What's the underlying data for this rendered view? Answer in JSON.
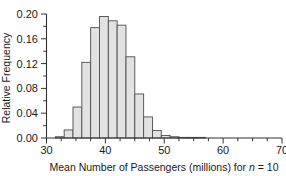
{
  "chart_data": {
    "type": "bar",
    "title": "",
    "subtitle": "",
    "xlabel_parts": {
      "before": "Mean Number of Passengers (millions) for ",
      "italic": "n",
      "after": " = 10"
    },
    "xlabel": "Mean Number of Passengers (millions) for n = 10",
    "ylabel": "Relative Frequency",
    "xlim": [
      30,
      70
    ],
    "ylim": [
      0.0,
      0.2
    ],
    "xticks": [
      30,
      40,
      50,
      60,
      70
    ],
    "xtick_labels": [
      "30",
      "40",
      "50",
      "60",
      "70"
    ],
    "xminor_step": 2.5,
    "yticks": [
      0.0,
      0.04,
      0.08,
      0.12,
      0.16,
      0.2
    ],
    "ytick_labels": [
      "0.00",
      "0.04",
      "0.08",
      "0.12",
      "0.16",
      "0.20"
    ],
    "yminor_step": 0.02,
    "grid": false,
    "legend": null,
    "bin_width": 1.5,
    "bin_edges": [
      30.0,
      31.5,
      33.0,
      34.5,
      36.0,
      37.5,
      39.0,
      40.5,
      42.0,
      43.5,
      45.0,
      46.5,
      48.0,
      49.5,
      51.0,
      52.5,
      54.0,
      55.5,
      57.0
    ],
    "categories": [
      "30.0-31.5",
      "31.5-33.0",
      "33.0-34.5",
      "34.5-36.0",
      "36.0-37.5",
      "37.5-39.0",
      "39.0-40.5",
      "40.5-42.0",
      "42.0-43.5",
      "43.5-45.0",
      "45.0-46.5",
      "46.5-48.0",
      "48.0-49.5",
      "49.5-51.0",
      "51.0-52.5",
      "52.5-54.0",
      "54.0-55.5",
      "55.5-57.0"
    ],
    "bin_centers": [
      30.75,
      32.25,
      33.75,
      35.25,
      36.75,
      38.25,
      39.75,
      41.25,
      42.75,
      44.25,
      45.75,
      47.25,
      48.75,
      50.25,
      51.75,
      53.25,
      54.75,
      56.25
    ],
    "values": [
      0.0,
      0.002,
      0.013,
      0.05,
      0.122,
      0.178,
      0.196,
      0.189,
      0.182,
      0.131,
      0.071,
      0.034,
      0.012,
      0.004,
      0.002,
      0.001,
      0.001,
      0.001
    ],
    "colors": {
      "bar_fill": "#e2e2e2",
      "bar_edge": "#4d4d4d",
      "axis": "#333333",
      "text": "#1a1a1a",
      "background": "#ffffff"
    }
  }
}
